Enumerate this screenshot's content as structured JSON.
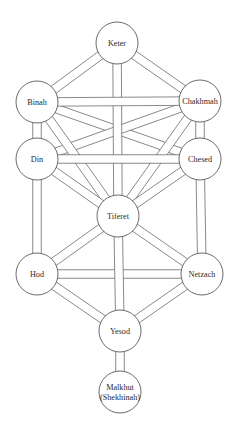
{
  "diagram": {
    "title": "",
    "style": {
      "line_color": "#6b6b6b",
      "circle_stroke": "#5a5a5a",
      "background": "#ffffff",
      "text_color": "#2a2a2a",
      "band_width": 8.5,
      "node_radius": 21
    },
    "nodes": [
      {
        "id": "keter",
        "lines": [
          "Keter"
        ],
        "x": 117,
        "y": 43
      },
      {
        "id": "binah",
        "lines": [
          "Binah"
        ],
        "x": 37,
        "y": 102
      },
      {
        "id": "chakhmah",
        "lines": [
          "Chakhmah"
        ],
        "x": 200,
        "y": 101
      },
      {
        "id": "din",
        "lines": [
          "Din"
        ],
        "x": 37,
        "y": 159
      },
      {
        "id": "chesed",
        "lines": [
          "Chesed"
        ],
        "x": 200,
        "y": 159
      },
      {
        "id": "tiferet",
        "lines": [
          "Tiferet"
        ],
        "x": 118,
        "y": 216
      },
      {
        "id": "hod",
        "lines": [
          "Hod"
        ],
        "x": 37,
        "y": 274
      },
      {
        "id": "netzach",
        "lines": [
          "Netzach"
        ],
        "x": 202,
        "y": 274
      },
      {
        "id": "yesod",
        "lines": [
          "Yesod"
        ],
        "x": 120,
        "y": 331
      },
      {
        "id": "malkhut",
        "lines": [
          "Malkhut",
          "(Shekhinah)"
        ],
        "x": 120,
        "y": 392
      }
    ],
    "edges": [
      [
        "binah",
        "chesed"
      ],
      [
        "chakhmah",
        "din"
      ],
      [
        "binah",
        "tiferet"
      ],
      [
        "chakhmah",
        "tiferet"
      ],
      [
        "din",
        "tiferet"
      ],
      [
        "chesed",
        "tiferet"
      ],
      [
        "keter",
        "binah"
      ],
      [
        "keter",
        "chakhmah"
      ],
      [
        "tiferet",
        "hod"
      ],
      [
        "tiferet",
        "netzach"
      ],
      [
        "hod",
        "yesod"
      ],
      [
        "netzach",
        "yesod"
      ],
      [
        "binah",
        "din"
      ],
      [
        "chakhmah",
        "chesed"
      ],
      [
        "din",
        "hod"
      ],
      [
        "chesed",
        "netzach"
      ],
      [
        "hod",
        "netzach"
      ],
      [
        "keter",
        "tiferet"
      ],
      [
        "binah",
        "chakhmah"
      ],
      [
        "din",
        "chesed"
      ],
      [
        "tiferet",
        "yesod"
      ],
      [
        "yesod",
        "malkhut"
      ]
    ]
  }
}
